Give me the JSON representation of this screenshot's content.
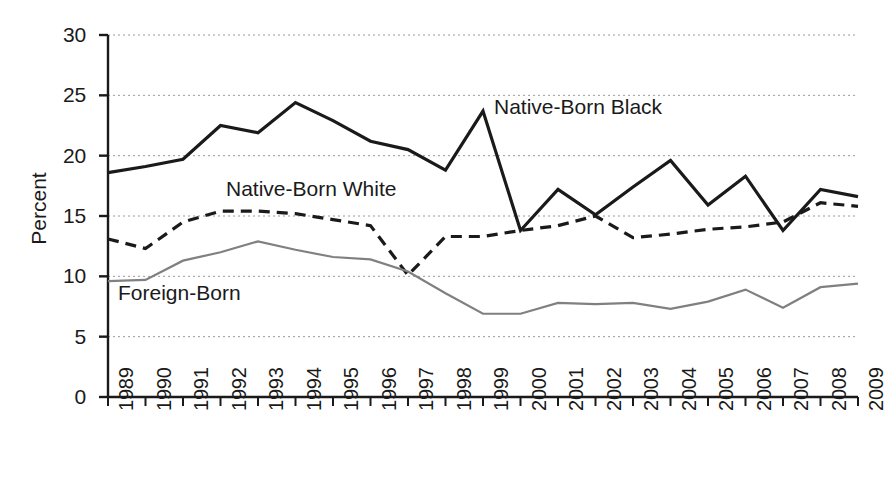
{
  "chart_data": {
    "type": "line",
    "title": "",
    "xlabel": "",
    "ylabel": "Percent",
    "ylim": [
      0,
      30
    ],
    "yticks": [
      0,
      5,
      10,
      15,
      20,
      25,
      30
    ],
    "grid": "horizontal-dotted",
    "legend_position": "inline-annotations",
    "x": [
      1989,
      1990,
      1991,
      1992,
      1993,
      1994,
      1995,
      1996,
      1997,
      1998,
      1999,
      2000,
      2001,
      2002,
      2003,
      2004,
      2005,
      2006,
      2007,
      2008,
      2009
    ],
    "categories": [
      "1989",
      "1990",
      "1991",
      "1992",
      "1993",
      "1994",
      "1995",
      "1996",
      "1997",
      "1998",
      "1999",
      "2000",
      "2001",
      "2002",
      "2003",
      "2004",
      "2005",
      "2006",
      "2007",
      "2008",
      "2009"
    ],
    "series": [
      {
        "name": "Native-Born Black",
        "style": "solid",
        "color": "#1a1a1a",
        "width": 3.2,
        "values": [
          18.6,
          19.1,
          19.7,
          22.5,
          21.9,
          24.4,
          22.9,
          21.2,
          20.5,
          18.8,
          23.7,
          13.8,
          17.2,
          15.1,
          17.4,
          19.6,
          15.9,
          18.3,
          13.8,
          17.2,
          16.6
        ]
      },
      {
        "name": "Native-Born White",
        "style": "dashed",
        "color": "#1a1a1a",
        "width": 3.2,
        "values": [
          13.1,
          12.3,
          14.5,
          15.4,
          15.4,
          15.2,
          14.7,
          14.2,
          10.1,
          13.3,
          13.3,
          13.8,
          14.2,
          15.0,
          13.2,
          13.5,
          13.9,
          14.1,
          14.5,
          16.1,
          15.8
        ]
      },
      {
        "name": "Foreign-Born",
        "style": "solid",
        "color": "#808080",
        "width": 2.2,
        "values": [
          9.6,
          9.7,
          11.3,
          12.0,
          12.9,
          12.2,
          11.6,
          11.4,
          10.4,
          8.6,
          6.9,
          6.9,
          7.8,
          7.7,
          7.8,
          7.3,
          7.9,
          8.9,
          7.4,
          9.1,
          9.4
        ]
      }
    ],
    "annotations": [
      {
        "text": "Native-Born Black",
        "series": "Native-Born Black"
      },
      {
        "text": "Native-Born White",
        "series": "Native-Born White"
      },
      {
        "text": "Foreign-Born",
        "series": "Foreign-Born"
      }
    ]
  },
  "axes": {
    "y_title": "Percent",
    "y_labels": [
      "30",
      "25",
      "20",
      "15",
      "10",
      "5",
      "0"
    ],
    "x_labels": [
      "1989",
      "1990",
      "1991",
      "1992",
      "1993",
      "1994",
      "1995",
      "1996",
      "1997",
      "1998",
      "1999",
      "2000",
      "2001",
      "2002",
      "2003",
      "2004",
      "2005",
      "2006",
      "2007",
      "2008",
      "2009"
    ]
  },
  "labels": {
    "native_born_black": "Native-Born Black",
    "native_born_white": "Native-Born White",
    "foreign_born": "Foreign-Born"
  },
  "colors": {
    "axis": "#1a1a1a",
    "grid": "#9a9a9a",
    "native_born_black": "#1a1a1a",
    "native_born_white": "#1a1a1a",
    "foreign_born": "#808080",
    "background": "#ffffff"
  }
}
